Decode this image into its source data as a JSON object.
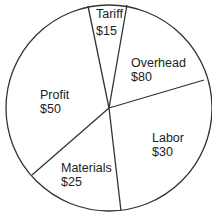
{
  "chart_data": {
    "type": "pie",
    "title": "",
    "slices": [
      {
        "label": "Tariff",
        "value_label": "$15",
        "value": 15
      },
      {
        "label": "Overhead",
        "value_label": "$80",
        "value": 80
      },
      {
        "label": "Labor",
        "value_label": "$30",
        "value": 30
      },
      {
        "label": "Materials",
        "value_label": "$25",
        "value": 25
      },
      {
        "label": "Profit",
        "value_label": "$50",
        "value": 50
      }
    ],
    "legend": "none",
    "labels_inside": true,
    "colors": {
      "fill": "#ffffff",
      "stroke": "#333333",
      "text": "#222222"
    }
  },
  "geometry": {
    "center": [
      109,
      108
    ],
    "radius": 103,
    "boundary_points": [
      [
        88,
        6
      ],
      [
        127,
        5
      ],
      [
        204,
        80
      ],
      [
        121,
        211
      ],
      [
        32,
        175
      ]
    ]
  },
  "labels": [
    {
      "name": "tariff",
      "label": "Tariff",
      "value": "$15",
      "x": 96,
      "y1": 18,
      "y2": 35
    },
    {
      "name": "overhead",
      "label": "Overhead",
      "value": "$80",
      "x": 131,
      "y1": 67,
      "y2": 81
    },
    {
      "name": "labor",
      "label": "Labor",
      "value": "$30",
      "x": 152,
      "y1": 142,
      "y2": 156
    },
    {
      "name": "materials",
      "label": "Materials",
      "value": "$25",
      "x": 61,
      "y1": 172,
      "y2": 186
    },
    {
      "name": "profit",
      "label": "Profit",
      "value": "$50",
      "x": 40,
      "y1": 99,
      "y2": 113
    }
  ]
}
